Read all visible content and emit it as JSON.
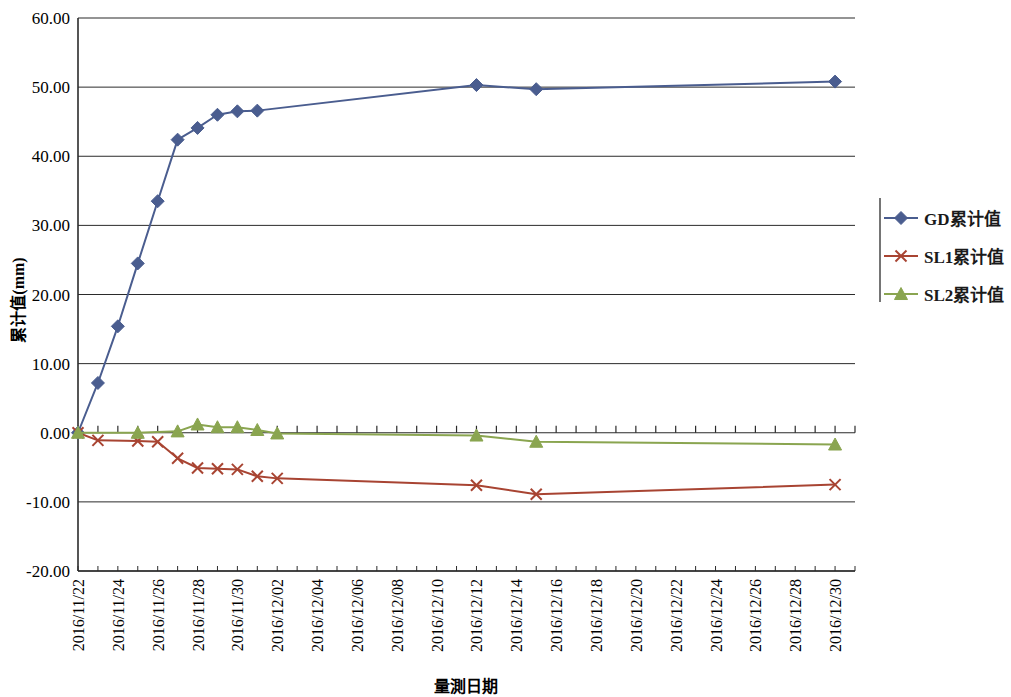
{
  "chart_data": {
    "type": "line",
    "title": "",
    "xlabel": "量測日期",
    "ylabel": "累计值(mm)",
    "ylim": [
      -20,
      60
    ],
    "ytick_step": 10,
    "ytick_labels": [
      "60.00",
      "50.00",
      "40.00",
      "30.00",
      "20.00",
      "10.00",
      "0.00",
      "-10.00",
      "-20.00"
    ],
    "ytick_values": [
      60,
      50,
      40,
      30,
      20,
      10,
      0,
      -10,
      -20
    ],
    "grid": true,
    "legend_position": "right",
    "x_start": "2016/11/22",
    "x_end": "2016/12/31",
    "xtick_labels": [
      "2016/11/22",
      "2016/11/24",
      "2016/11/26",
      "2016/11/28",
      "2016/11/30",
      "2016/12/02",
      "2016/12/04",
      "2016/12/06",
      "2016/12/08",
      "2016/12/10",
      "2016/12/12",
      "2016/12/14",
      "2016/12/16",
      "2016/12/18",
      "2016/12/20",
      "2016/12/22",
      "2016/12/24",
      "2016/12/26",
      "2016/12/28",
      "2016/12/30"
    ],
    "xtick_days": [
      0,
      2,
      4,
      6,
      8,
      10,
      12,
      14,
      16,
      18,
      20,
      22,
      24,
      26,
      28,
      30,
      32,
      34,
      36,
      38
    ],
    "series": [
      {
        "name": "GD累计值",
        "color": "#4a5d8f",
        "marker": "diamond",
        "x_days": [
          0,
          1,
          2,
          3,
          4,
          5,
          6,
          7,
          8,
          9,
          20,
          23,
          38
        ],
        "values": [
          0.0,
          7.2,
          15.4,
          24.5,
          33.5,
          42.4,
          44.1,
          46.0,
          46.5,
          46.6,
          50.3,
          49.7,
          50.8
        ]
      },
      {
        "name": "SL1累计值",
        "color": "#a84432",
        "marker": "cross",
        "x_days": [
          0,
          1,
          3,
          4,
          5,
          6,
          7,
          8,
          9,
          10,
          20,
          23,
          38
        ],
        "values": [
          0.0,
          -1.1,
          -1.2,
          -1.3,
          -3.7,
          -5.1,
          -5.2,
          -5.3,
          -6.3,
          -6.6,
          -7.6,
          -8.9,
          -7.5
        ]
      },
      {
        "name": "SL2累计值",
        "color": "#8aa550",
        "marker": "triangle",
        "x_days": [
          0,
          3,
          5,
          6,
          7,
          8,
          9,
          10,
          20,
          23,
          38
        ],
        "values": [
          0.0,
          0.0,
          0.2,
          1.2,
          0.8,
          0.8,
          0.4,
          -0.1,
          -0.4,
          -1.3,
          -1.7
        ]
      }
    ]
  },
  "legend": {
    "items": [
      {
        "label": "GD累计值",
        "color": "#4a5d8f",
        "marker": "diamond"
      },
      {
        "label": "SL1累计值",
        "color": "#a84432",
        "marker": "cross"
      },
      {
        "label": "SL2累计值",
        "color": "#8aa550",
        "marker": "triangle"
      }
    ]
  }
}
